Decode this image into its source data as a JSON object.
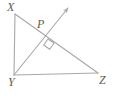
{
  "diagram": {
    "type": "geometry-figure",
    "background_color": "#ffffff",
    "stroke_color": "#a8a8a8",
    "label_color": "#5b5b5b",
    "labels": {
      "x": "X",
      "p": "P",
      "y": "Y",
      "z": "Z"
    },
    "points": {
      "X": {
        "x": 15,
        "y": 14
      },
      "P": {
        "x": 48,
        "y": 39
      },
      "Y": {
        "x": 14,
        "y": 75
      },
      "Z": {
        "x": 98,
        "y": 73
      },
      "ray_tip": {
        "x": 69,
        "y": 7
      }
    },
    "segments": [
      {
        "name": "XY",
        "from": "X",
        "to": "Y"
      },
      {
        "name": "XZ",
        "from": "X",
        "to": "Z"
      },
      {
        "name": "YZ",
        "from": "Y",
        "to": "Z"
      },
      {
        "name": "YP-ray",
        "from": "Y",
        "to": "ray_tip",
        "arrow": true
      }
    ],
    "markers": [
      {
        "name": "right-angle-square",
        "at": "P",
        "size": 8
      }
    ]
  }
}
